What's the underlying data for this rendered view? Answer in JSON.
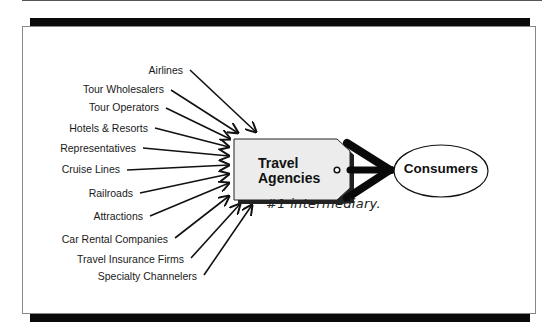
{
  "diagram": {
    "type": "flow-into-intermediary",
    "suppliers": [
      {
        "label": "Airlines",
        "y": 70,
        "right": 183
      },
      {
        "label": "Tour Wholesalers",
        "y": 89,
        "right": 164
      },
      {
        "label": "Tour Operators",
        "y": 107,
        "right": 159
      },
      {
        "label": "Hotels & Resorts",
        "y": 128,
        "right": 148
      },
      {
        "label": "Representatives",
        "y": 148,
        "right": 136
      },
      {
        "label": "Cruise Lines",
        "y": 169,
        "right": 120
      },
      {
        "label": "Railroads",
        "y": 193,
        "right": 133
      },
      {
        "label": "Attractions",
        "y": 216,
        "right": 143
      },
      {
        "label": "Car Rental Companies",
        "y": 239,
        "right": 168
      },
      {
        "label": "Travel Insurance Firms",
        "y": 259,
        "right": 184
      },
      {
        "label": "Specialty Channelers",
        "y": 276,
        "right": 197
      }
    ],
    "intermediary": {
      "line1": "Travel",
      "line2": "Agencies",
      "shape": "luggage-tag",
      "fill": "#ececec"
    },
    "destination": {
      "label": "Consumers",
      "shape": "ellipse"
    },
    "annotation": "#1 intermediary."
  }
}
